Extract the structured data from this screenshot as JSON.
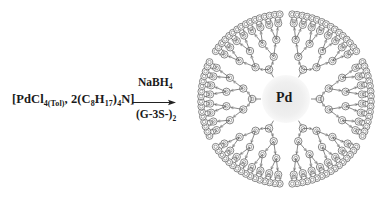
{
  "reaction": {
    "reactant": {
      "parts": [
        {
          "t": "[PdCl",
          "sub": "4(Tol)"
        },
        {
          "t": ", 2(C",
          "sub": "8"
        },
        {
          "t": "H",
          "sub": "17"
        },
        {
          "t": ")",
          "sub": "4"
        },
        {
          "t": "N]",
          "sub": ""
        }
      ]
    },
    "reagent_above_arrow": {
      "parts": [
        {
          "t": "NaBH",
          "sub": "4"
        }
      ]
    },
    "reagent_below_arrow": {
      "parts": [
        {
          "t": "(G-3S-)",
          "sub": "2"
        }
      ]
    },
    "arrow_icon": "right-arrow-icon"
  },
  "product": {
    "core_label": "Pd",
    "core_color": "#ececec",
    "line_color": "#555555",
    "atom_color": "#b5b5b5",
    "dendron_count": 6,
    "generations": 3,
    "center": [
      286,
      99
    ],
    "core_radius": 22,
    "outer_radius": 88
  }
}
